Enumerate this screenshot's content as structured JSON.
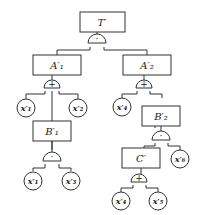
{
  "diagram": {
    "type": "fault-tree",
    "colors": {
      "stroke": "#333333",
      "background": "#ffffff",
      "text": "#222222"
    },
    "events": [
      {
        "id": "T",
        "label": "T′",
        "kind": "top-event",
        "gate": "AND",
        "gate_symbol": "·"
      },
      {
        "id": "A1",
        "label": "A′₁",
        "kind": "intermediate",
        "gate": "OR",
        "gate_symbol": "+"
      },
      {
        "id": "A2",
        "label": "A′₂",
        "kind": "intermediate",
        "gate": "OR",
        "gate_symbol": "+"
      },
      {
        "id": "B1",
        "label": "B′₁",
        "kind": "intermediate",
        "gate": "AND",
        "gate_symbol": "·"
      },
      {
        "id": "B2",
        "label": "B′₂",
        "kind": "intermediate",
        "gate": "AND",
        "gate_symbol": "·"
      },
      {
        "id": "C",
        "label": "C′",
        "kind": "intermediate",
        "gate": "OR",
        "gate_symbol": "+"
      }
    ],
    "basic_events": [
      {
        "id": "a1x1",
        "label": "x′₁",
        "parent": "A1"
      },
      {
        "id": "a1x2",
        "label": "x′₂",
        "parent": "A1"
      },
      {
        "id": "b1x1",
        "label": "x′₁",
        "parent": "B1"
      },
      {
        "id": "b1x3",
        "label": "x′₃",
        "parent": "B1"
      },
      {
        "id": "a2x4",
        "label": "x′₄",
        "parent": "A2"
      },
      {
        "id": "b2x6",
        "label": "x′₆",
        "parent": "B2"
      },
      {
        "id": "cx4",
        "label": "x′₄",
        "parent": "C"
      },
      {
        "id": "cx5",
        "label": "x′₅",
        "parent": "C"
      }
    ],
    "edges": [
      [
        "T",
        "A1"
      ],
      [
        "T",
        "A2"
      ],
      [
        "A1",
        "a1x1"
      ],
      [
        "A1",
        "B1"
      ],
      [
        "A1",
        "a1x2"
      ],
      [
        "B1",
        "b1x1"
      ],
      [
        "B1",
        "b1x3"
      ],
      [
        "A2",
        "a2x4"
      ],
      [
        "A2",
        "B2"
      ],
      [
        "B2",
        "C"
      ],
      [
        "B2",
        "b2x6"
      ],
      [
        "C",
        "cx4"
      ],
      [
        "C",
        "cx5"
      ]
    ]
  }
}
